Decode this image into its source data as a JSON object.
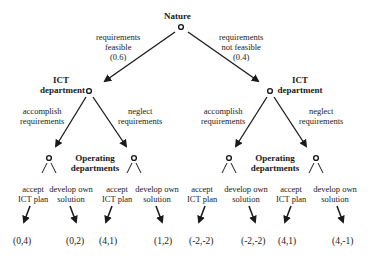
{
  "diagram": {
    "type": "game-tree",
    "root": {
      "player": "Nature",
      "branches": [
        {
          "label_lines": [
            "requirements",
            "feasible",
            "(0.6)"
          ]
        },
        {
          "label_lines": [
            "requirements",
            "not feasible",
            "(0.4)"
          ]
        }
      ]
    },
    "ict": {
      "left_label": [
        "ICT",
        "department"
      ],
      "right_label": [
        "ICT",
        "department"
      ],
      "actions": {
        "accomplish": [
          "accomplish",
          "requirements"
        ],
        "neglect": [
          "neglect",
          "requirements"
        ]
      }
    },
    "operating": {
      "label": [
        "Operating",
        "departments"
      ],
      "actions": {
        "accept": [
          "accept",
          "ICT plan"
        ],
        "develop": [
          "develop own",
          "solution"
        ]
      }
    },
    "payoffs": [
      "(0,4)",
      "(0,2)",
      "(4,1)",
      "(1,2)",
      "(-2,-2)",
      "(-2,-2)",
      "(4,1)",
      "(4,-1)"
    ],
    "colors": {
      "line": "#1a1a1a",
      "background": "#ffffff"
    }
  }
}
